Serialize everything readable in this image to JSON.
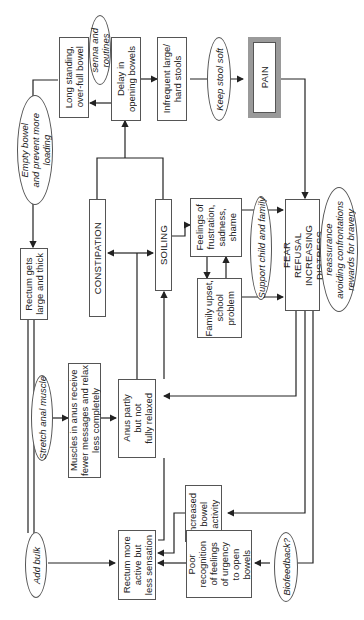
{
  "diagram": {
    "orientation": "rotated 90 degrees counter-clockwise",
    "boxes": {
      "long_standing": "Long standing,\nover-full bowel",
      "delay": "Delay in\nopening bowels",
      "infrequent": "Infrequent large/\nhard stools",
      "pain": "PAIN",
      "constipation": "CONSTIPATION",
      "soiling": "SOILING",
      "feelings": "Feelings of\nfrustration,\nsadness,\nshame",
      "family": "Family upset,\nschool\nproblem",
      "fear": "FEAR\nREFUSAL\nINCREASING DISTRESS",
      "rectum_large": "Rectum gets\nlarge and thick",
      "muscles": "Muscles in anus receive\nfewer messages and relax\nless completely",
      "anus": "Anus partly\nbut not\nfully relaxed",
      "increased": "Increased\nbowel\nactivity",
      "rectum_active": "Rectum more\nactive but\nless sensation",
      "poor": "Poor\nrecognition\nof feelings\nof urgency\nto open\nbowels"
    },
    "interventions": {
      "senna": "senna and\nroutines",
      "keep_soft": "Keep stool soft",
      "empty_bowel": "Empty bowel\nand prevent more\nloading",
      "stretch": "Stretch anal muscle",
      "support": "Support child and family",
      "reassurance": "reassurance\navoiding confrontations\nrewards for bravery",
      "add_bulk": "Add bulk",
      "biofeedback": "Biofeedback?"
    }
  }
}
